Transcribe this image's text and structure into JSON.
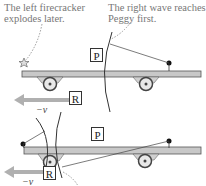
{
  "annotations": {
    "top_left": [
      "The left firecracker",
      "explodes later."
    ],
    "top_right": [
      "The right wave reaches",
      "Peggy first."
    ]
  },
  "panel_top": {
    "peggy_label": "P",
    "ryan_label": "R",
    "velocity_label": "−v"
  },
  "panel_bottom": {
    "peggy_label": "P",
    "ryan_label": "R",
    "velocity_label": "−v"
  },
  "colors": {
    "flatcar": "#c8c8c8",
    "arrow": "#b0b0b0",
    "text": "#777777",
    "line": "#333333"
  }
}
